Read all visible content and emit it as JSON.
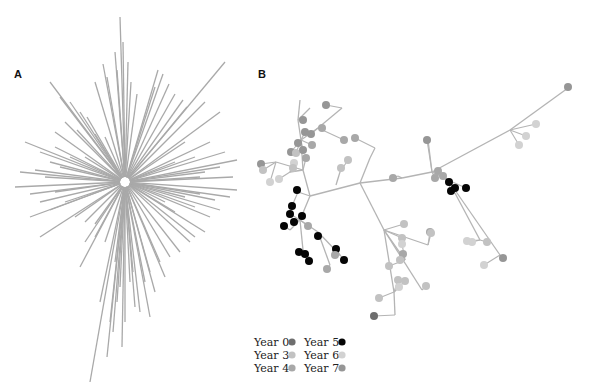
{
  "figure": {
    "panel_a": {
      "label": "A",
      "type": "radial-tree",
      "center": [
        125,
        182
      ],
      "branch_color": "#a9a9a9"
    },
    "panel_b": {
      "label": "B",
      "type": "tree-with-tip-colors",
      "branch_color": "#b4b4b4"
    },
    "legend": {
      "items": [
        {
          "label": "Year 0",
          "color": "#6e6e6e"
        },
        {
          "label": "Year 3",
          "color": "#c2c2c2"
        },
        {
          "label": "Year 4",
          "color": "#a8a8a8"
        },
        {
          "label": "Year 5",
          "color": "#050505"
        },
        {
          "label": "Year 6",
          "color": "#d2d2d2"
        },
        {
          "label": "Year 7",
          "color": "#969696"
        }
      ]
    }
  },
  "panel_a_rays": [
    [
      -5,
      -165
    ],
    [
      -2,
      -140
    ],
    [
      3,
      -120
    ],
    [
      -10,
      -130
    ],
    [
      -22,
      -118
    ],
    [
      -30,
      -100
    ],
    [
      -18,
      -105
    ],
    [
      -8,
      -112
    ],
    [
      6,
      -100
    ],
    [
      12,
      -88
    ],
    [
      33,
      -112
    ],
    [
      38,
      -108
    ],
    [
      30,
      -95
    ],
    [
      44,
      -98
    ],
    [
      50,
      -88
    ],
    [
      58,
      -82
    ],
    [
      62,
      -75
    ],
    [
      100,
      -120
    ],
    [
      80,
      -80
    ],
    [
      95,
      -70
    ],
    [
      -75,
      -100
    ],
    [
      -65,
      -85
    ],
    [
      -55,
      -80
    ],
    [
      -45,
      -70
    ],
    [
      -38,
      -65
    ],
    [
      -60,
      -60
    ],
    [
      -48,
      -52
    ],
    [
      -70,
      -50
    ],
    [
      -30,
      -48
    ],
    [
      -20,
      -45
    ],
    [
      -100,
      -40
    ],
    [
      -85,
      -30
    ],
    [
      -75,
      -20
    ],
    [
      -90,
      -12
    ],
    [
      -105,
      -10
    ],
    [
      -80,
      -5
    ],
    [
      -65,
      -15
    ],
    [
      -55,
      -25
    ],
    [
      -70,
      -35
    ],
    [
      -40,
      -25
    ],
    [
      100,
      -30
    ],
    [
      112,
      -22
    ],
    [
      95,
      -15
    ],
    [
      80,
      -10
    ],
    [
      70,
      -25
    ],
    [
      85,
      -40
    ],
    [
      60,
      -40
    ],
    [
      108,
      -5
    ],
    [
      75,
      -5
    ],
    [
      50,
      -20
    ],
    [
      112,
      8
    ],
    [
      105,
      15
    ],
    [
      90,
      18
    ],
    [
      75,
      12
    ],
    [
      95,
      28
    ],
    [
      85,
      35
    ],
    [
      70,
      25
    ],
    [
      60,
      15
    ],
    [
      50,
      30
    ],
    [
      40,
      20
    ],
    [
      -110,
      5
    ],
    [
      -95,
      12
    ],
    [
      -85,
      20
    ],
    [
      -75,
      28
    ],
    [
      -60,
      20
    ],
    [
      -50,
      35
    ],
    [
      -40,
      40
    ],
    [
      -30,
      42
    ],
    [
      -70,
      10
    ],
    [
      -95,
      35
    ],
    [
      -85,
      55
    ],
    [
      -45,
      85
    ],
    [
      -40,
      60
    ],
    [
      -30,
      55
    ],
    [
      -20,
      60
    ],
    [
      -10,
      80
    ],
    [
      -5,
      105
    ],
    [
      0,
      140
    ],
    [
      -3,
      165
    ],
    [
      -15,
      140
    ],
    [
      -25,
      120
    ],
    [
      -35,
      200
    ],
    [
      -12,
      150
    ],
    [
      -18,
      175
    ],
    [
      5,
      100
    ],
    [
      10,
      125
    ],
    [
      15,
      130
    ],
    [
      20,
      100
    ],
    [
      25,
      90
    ],
    [
      35,
      80
    ],
    [
      45,
      75
    ],
    [
      55,
      70
    ],
    [
      65,
      60
    ],
    [
      70,
      55
    ],
    [
      80,
      50
    ],
    [
      40,
      95
    ],
    [
      30,
      110
    ],
    [
      25,
      135
    ],
    [
      8,
      90
    ],
    [
      -8,
      120
    ]
  ],
  "panel_b_tree": {
    "edges": [
      [
        310,
        196,
        360,
        183
      ],
      [
        360,
        183,
        402,
        178
      ],
      [
        402,
        178,
        432,
        172
      ],
      [
        432,
        172,
        448,
        180
      ],
      [
        310,
        196,
        303,
        170
      ],
      [
        303,
        170,
        301,
        140
      ],
      [
        301,
        140,
        298,
        120
      ],
      [
        298,
        120,
        300,
        100
      ],
      [
        301,
        140,
        318,
        128
      ],
      [
        318,
        128,
        342,
        108
      ],
      [
        298,
        120,
        310,
        108
      ],
      [
        303,
        170,
        276,
        162
      ],
      [
        303,
        170,
        290,
        172
      ],
      [
        310,
        196,
        298,
        192
      ],
      [
        310,
        196,
        300,
        220
      ],
      [
        300,
        220,
        290,
        230
      ],
      [
        300,
        220,
        318,
        232
      ],
      [
        300,
        220,
        303,
        250
      ],
      [
        318,
        232,
        340,
        255
      ],
      [
        318,
        232,
        330,
        265
      ],
      [
        303,
        250,
        310,
        258
      ],
      [
        360,
        183,
        384,
        230
      ],
      [
        384,
        230,
        428,
        245
      ],
      [
        384,
        230,
        394,
        292
      ],
      [
        394,
        292,
        395,
        315
      ],
      [
        384,
        230,
        405,
        260
      ],
      [
        384,
        230,
        422,
        290
      ],
      [
        432,
        172,
        510,
        130
      ],
      [
        510,
        130,
        568,
        88
      ],
      [
        432,
        172,
        428,
        140
      ],
      [
        448,
        180,
        480,
        240
      ],
      [
        448,
        180,
        500,
        255
      ],
      [
        360,
        183,
        370,
        158
      ],
      [
        370,
        158,
        375,
        148
      ],
      [
        402,
        178,
        398,
        176
      ],
      [
        340,
        172,
        336,
        185
      ]
    ],
    "nodes": [
      [
        326,
        105,
        "#969696"
      ],
      [
        303,
        120,
        "#969696"
      ],
      [
        305,
        132,
        "#969696"
      ],
      [
        298,
        143,
        "#969696"
      ],
      [
        291,
        152,
        "#969696"
      ],
      [
        296,
        153,
        "#c2c2c2"
      ],
      [
        303,
        150,
        "#969696"
      ],
      [
        311,
        134,
        "#969696"
      ],
      [
        322,
        128,
        "#a8a8a8"
      ],
      [
        312,
        145,
        "#a8a8a8"
      ],
      [
        294,
        163,
        "#d2d2d2"
      ],
      [
        306,
        158,
        "#a8a8a8"
      ],
      [
        261,
        164,
        "#969696"
      ],
      [
        263,
        170,
        "#c2c2c2"
      ],
      [
        270,
        182,
        "#d2d2d2"
      ],
      [
        279,
        179,
        "#d2d2d2"
      ],
      [
        293,
        168,
        "#c2c2c2"
      ],
      [
        297,
        190,
        "#050505"
      ],
      [
        292,
        206,
        "#050505"
      ],
      [
        290,
        214,
        "#050505"
      ],
      [
        294,
        222,
        "#050505"
      ],
      [
        284,
        226,
        "#050505"
      ],
      [
        302,
        216,
        "#050505"
      ],
      [
        308,
        226,
        "#a8a8a8"
      ],
      [
        318,
        236,
        "#050505"
      ],
      [
        299,
        252,
        "#050505"
      ],
      [
        305,
        254,
        "#050505"
      ],
      [
        309,
        261,
        "#050505"
      ],
      [
        336,
        249,
        "#050505"
      ],
      [
        335,
        255,
        "#a8a8a8"
      ],
      [
        344,
        260,
        "#050505"
      ],
      [
        327,
        269,
        "#a8a8a8"
      ],
      [
        344,
        140,
        "#a8a8a8"
      ],
      [
        355,
        138,
        "#a8a8a8"
      ],
      [
        348,
        160,
        "#c2c2c2"
      ],
      [
        341,
        168,
        "#c2c2c2"
      ],
      [
        393,
        178,
        "#a8a8a8"
      ],
      [
        427,
        140,
        "#969696"
      ],
      [
        435,
        178,
        "#a8a8a8"
      ],
      [
        438,
        171,
        "#a8a8a8"
      ],
      [
        443,
        176,
        "#a8a8a8"
      ],
      [
        449,
        182,
        "#050505"
      ],
      [
        451,
        191,
        "#050505"
      ],
      [
        455,
        188,
        "#050505"
      ],
      [
        466,
        188,
        "#050505"
      ],
      [
        519,
        145,
        "#d2d2d2"
      ],
      [
        526,
        136,
        "#d2d2d2"
      ],
      [
        536,
        124,
        "#d2d2d2"
      ],
      [
        568,
        87,
        "#969696"
      ],
      [
        430,
        232,
        "#a8a8a8"
      ],
      [
        467,
        241,
        "#d2d2d2"
      ],
      [
        487,
        242,
        "#c2c2c2"
      ],
      [
        472,
        242,
        "#d2d2d2"
      ],
      [
        503,
        258,
        "#969696"
      ],
      [
        484,
        265,
        "#d2d2d2"
      ],
      [
        404,
        224,
        "#c2c2c2"
      ],
      [
        431,
        233,
        "#c2c2c2"
      ],
      [
        402,
        238,
        "#c2c2c2"
      ],
      [
        402,
        244,
        "#d2d2d2"
      ],
      [
        403,
        254,
        "#a8a8a8"
      ],
      [
        400,
        260,
        "#c2c2c2"
      ],
      [
        389,
        266,
        "#c2c2c2"
      ],
      [
        398,
        280,
        "#c2c2c2"
      ],
      [
        405,
        281,
        "#c2c2c2"
      ],
      [
        399,
        287,
        "#d2d2d2"
      ],
      [
        426,
        286,
        "#c2c2c2"
      ],
      [
        379,
        298,
        "#c2c2c2"
      ],
      [
        374,
        316,
        "#6e6e6e"
      ]
    ]
  }
}
